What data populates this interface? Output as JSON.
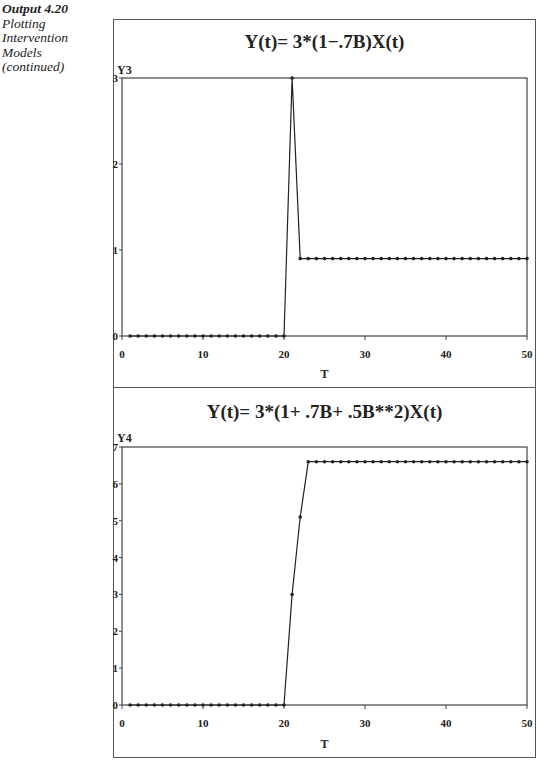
{
  "caption": {
    "number": "Output 4.20",
    "lines": [
      "Plotting",
      "Intervention",
      "Models",
      "(continued)"
    ]
  },
  "chart_data": [
    {
      "type": "line",
      "title": "Y(t)= 3*(1−.7B)X(t)",
      "xlabel": "T",
      "ylabel": "Y3",
      "xlim": [
        0,
        50
      ],
      "ylim": [
        0,
        3
      ],
      "xticks": [
        0,
        10,
        20,
        30,
        40,
        50
      ],
      "yticks": [
        0,
        1,
        2,
        3
      ],
      "grid": false,
      "markers": true,
      "x": [
        1,
        2,
        3,
        4,
        5,
        6,
        7,
        8,
        9,
        10,
        11,
        12,
        13,
        14,
        15,
        16,
        17,
        18,
        19,
        20,
        21,
        22,
        23,
        24,
        25,
        26,
        27,
        28,
        29,
        30,
        31,
        32,
        33,
        34,
        35,
        36,
        37,
        38,
        39,
        40,
        41,
        42,
        43,
        44,
        45,
        46,
        47,
        48,
        49,
        50
      ],
      "values": [
        0,
        0,
        0,
        0,
        0,
        0,
        0,
        0,
        0,
        0,
        0,
        0,
        0,
        0,
        0,
        0,
        0,
        0,
        0,
        0,
        3,
        0.9,
        0.9,
        0.9,
        0.9,
        0.9,
        0.9,
        0.9,
        0.9,
        0.9,
        0.9,
        0.9,
        0.9,
        0.9,
        0.9,
        0.9,
        0.9,
        0.9,
        0.9,
        0.9,
        0.9,
        0.9,
        0.9,
        0.9,
        0.9,
        0.9,
        0.9,
        0.9,
        0.9,
        0.9
      ]
    },
    {
      "type": "line",
      "title": "Y(t)= 3*(1+ .7B+ .5B**2)X(t)",
      "xlabel": "T",
      "ylabel": "Y4",
      "xlim": [
        0,
        50
      ],
      "ylim": [
        0,
        7
      ],
      "xticks": [
        0,
        10,
        20,
        30,
        40,
        50
      ],
      "yticks": [
        0,
        1,
        2,
        3,
        4,
        5,
        6,
        7
      ],
      "grid": false,
      "markers": true,
      "x": [
        1,
        2,
        3,
        4,
        5,
        6,
        7,
        8,
        9,
        10,
        11,
        12,
        13,
        14,
        15,
        16,
        17,
        18,
        19,
        20,
        21,
        22,
        23,
        24,
        25,
        26,
        27,
        28,
        29,
        30,
        31,
        32,
        33,
        34,
        35,
        36,
        37,
        38,
        39,
        40,
        41,
        42,
        43,
        44,
        45,
        46,
        47,
        48,
        49,
        50
      ],
      "values": [
        0,
        0,
        0,
        0,
        0,
        0,
        0,
        0,
        0,
        0,
        0,
        0,
        0,
        0,
        0,
        0,
        0,
        0,
        0,
        0,
        3,
        5.1,
        6.6,
        6.6,
        6.6,
        6.6,
        6.6,
        6.6,
        6.6,
        6.6,
        6.6,
        6.6,
        6.6,
        6.6,
        6.6,
        6.6,
        6.6,
        6.6,
        6.6,
        6.6,
        6.6,
        6.6,
        6.6,
        6.6,
        6.6,
        6.6,
        6.6,
        6.6,
        6.6,
        6.6
      ]
    }
  ],
  "colors": {
    "line": "#222222",
    "frame": "#555555"
  }
}
